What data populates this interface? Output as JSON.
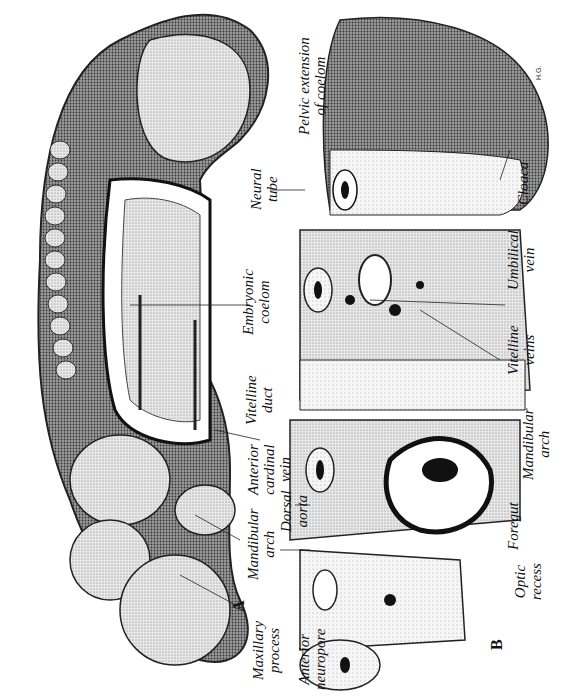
{
  "figure": {
    "panels": [
      {
        "id": "A",
        "label": "A",
        "description": "Lateral view of embryo"
      },
      {
        "id": "B",
        "label": "B",
        "description": "Serial transverse sections"
      }
    ],
    "signature": "H.G.",
    "labels": {
      "maxillary_process": [
        "Maxillary",
        "process"
      ],
      "mandibular_arch_a": [
        "Mandibular",
        "arch"
      ],
      "anterior_cardinal_vein": [
        "Anterior",
        "cardinal",
        "vein"
      ],
      "dorsal_aorta": [
        "Dorsal",
        "aorta"
      ],
      "vitelline_duct": [
        "Vitelline",
        "duct"
      ],
      "embryonic_coelom": [
        "Embryonic",
        "coelom"
      ],
      "neural_tube": [
        "Neural",
        "tube"
      ],
      "pelvic_extension": [
        "Pelvic extension",
        "of coelom"
      ],
      "anterior_neuropore": [
        "Anterior",
        "neuropore"
      ],
      "optic_recess": [
        "Optic",
        "recess"
      ],
      "foregut": [
        "Foregut"
      ],
      "mandibular_arch_b": [
        "Mandibular",
        "arch"
      ],
      "vitelline_veins": [
        "Vitelline",
        "veins"
      ],
      "umbilical_vein": [
        "Umbilical",
        "vein"
      ],
      "cloaca": [
        "Cloaca"
      ]
    }
  }
}
